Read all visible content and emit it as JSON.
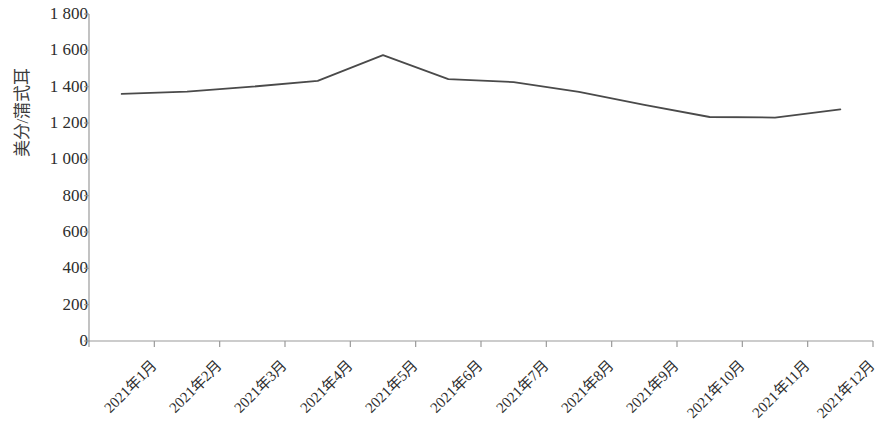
{
  "chart_data": {
    "type": "line",
    "title": "",
    "subtitle": "",
    "xlabel": "",
    "ylabel": "美分/蒲式耳",
    "categories": [
      "2021年1月",
      "2021年2月",
      "2021年3月",
      "2021年4月",
      "2021年5月",
      "2021年6月",
      "2021年7月",
      "2021年8月",
      "2021年9月",
      "2021年10月",
      "2021年11月",
      "2021年12月"
    ],
    "values": [
      1360,
      1373,
      1400,
      1432,
      1574,
      1442,
      1425,
      1371,
      1300,
      1233,
      1230,
      1275
    ],
    "series": [
      {
        "name": "",
        "values": [
          1360,
          1373,
          1400,
          1432,
          1574,
          1442,
          1425,
          1371,
          1300,
          1233,
          1230,
          1275
        ]
      }
    ],
    "ylim": [
      0,
      1800
    ],
    "ytick_step": 200,
    "ytick_labels": [
      "0",
      "200",
      "400",
      "600",
      "800",
      "1 000",
      "1 200",
      "1 400",
      "1 600",
      "1 800"
    ],
    "ytick_values": [
      0,
      200,
      400,
      600,
      800,
      1000,
      1200,
      1400,
      1600,
      1800
    ],
    "grid": false,
    "legend": false,
    "legend_position": "none",
    "line_color": "#4a4a4a",
    "axis_color": "#9a9a9a",
    "text_color": "#2d2d2d",
    "background": "#ffffff"
  }
}
